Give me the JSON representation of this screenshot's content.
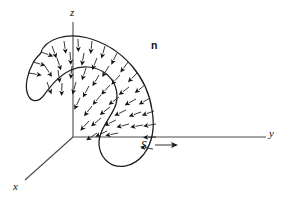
{
  "figure": {
    "caption_absent": true,
    "background_color": "#ffffff",
    "ink_color": "#141414",
    "axis_color": "#4a4a4a",
    "width": 289,
    "height": 202
  },
  "axes": {
    "origin": {
      "x": 73,
      "y": 137
    },
    "z": {
      "label": "z",
      "label_x": 71,
      "label_y": 8,
      "from": {
        "x": 73,
        "y": 137
      },
      "to": {
        "x": 73,
        "y": 22
      }
    },
    "y": {
      "label": "y",
      "label_x": 271,
      "label_y": 130,
      "from": {
        "x": 73,
        "y": 137
      },
      "to": {
        "x": 266,
        "y": 137
      }
    },
    "x": {
      "label": "x",
      "label_x": 14,
      "label_y": 183,
      "from": {
        "x": 73,
        "y": 137
      },
      "to": {
        "x": 25,
        "y": 180
      }
    }
  },
  "labels": {
    "normal_vector": "n",
    "normal_x": 152,
    "normal_y": 44,
    "surface": "S",
    "surface_x": 143,
    "surface_y": 141
  },
  "surface": {
    "name": "S",
    "description": "oriented curved surface shaped like a bent sheet crossing the z axis",
    "outline_path": "M 40.5 53.5 C 45 38 68 33 86 37.5 C 104 42 120 52 132 66 C 144 80 150 96 152 110 C 155 127 152 143 144 154 C 134 167 118 170 108 162 C 99 155 97 143 101 133 C 105 122 113 114 116 104 C 119 92 115 80 105 73 C 95 66 82 65 71 70 C 58 76 50 87 44 95 C 38 103 31 102 28 95 C 24 86 28 72 33 63 C 35 59 38 56 40.5 53.5 Z",
    "crosses_axes": true
  },
  "chart_data": {
    "type": "diagram",
    "title": "",
    "subtitle": "",
    "elements": [
      {
        "kind": "axis",
        "label": "z",
        "direction": "up"
      },
      {
        "kind": "axis",
        "label": "y",
        "direction": "right"
      },
      {
        "kind": "axis",
        "label": "x",
        "direction": "down-left"
      },
      {
        "kind": "surface",
        "label": "S"
      },
      {
        "kind": "vector-field",
        "label": "n",
        "count": 78,
        "style": "outward unit normals"
      }
    ],
    "normals": [
      {
        "x": 41,
        "y": 52,
        "angle": 200
      },
      {
        "x": 33,
        "y": 62,
        "angle": 196
      },
      {
        "x": 29,
        "y": 73,
        "angle": 190
      },
      {
        "x": 52,
        "y": 46,
        "angle": 250
      },
      {
        "x": 64,
        "y": 41,
        "angle": 262
      },
      {
        "x": 78,
        "y": 39,
        "angle": 268
      },
      {
        "x": 92,
        "y": 41,
        "angle": 276
      },
      {
        "x": 105,
        "y": 46,
        "angle": 286
      },
      {
        "x": 117,
        "y": 53,
        "angle": 296
      },
      {
        "x": 128,
        "y": 62,
        "angle": 306
      },
      {
        "x": 137,
        "y": 73,
        "angle": 314
      },
      {
        "x": 145,
        "y": 85,
        "angle": 322
      },
      {
        "x": 150,
        "y": 98,
        "angle": 330
      },
      {
        "x": 154,
        "y": 111,
        "angle": 340
      },
      {
        "x": 156,
        "y": 124,
        "angle": 350
      },
      {
        "x": 156,
        "y": 137,
        "angle": 358
      },
      {
        "x": 153,
        "y": 149,
        "angle": 10
      },
      {
        "x": 57,
        "y": 58,
        "angle": 252
      },
      {
        "x": 70,
        "y": 52,
        "angle": 266
      },
      {
        "x": 84,
        "y": 53,
        "angle": 280
      },
      {
        "x": 97,
        "y": 58,
        "angle": 292
      },
      {
        "x": 109,
        "y": 66,
        "angle": 302
      },
      {
        "x": 120,
        "y": 75,
        "angle": 312
      },
      {
        "x": 129,
        "y": 87,
        "angle": 322
      },
      {
        "x": 136,
        "y": 99,
        "angle": 331
      },
      {
        "x": 141,
        "y": 112,
        "angle": 340
      },
      {
        "x": 143,
        "y": 125,
        "angle": 350
      },
      {
        "x": 45,
        "y": 66,
        "angle": 238
      },
      {
        "x": 58,
        "y": 70,
        "angle": 262
      },
      {
        "x": 72,
        "y": 66,
        "angle": 276
      },
      {
        "x": 86,
        "y": 68,
        "angle": 288
      },
      {
        "x": 99,
        "y": 75,
        "angle": 300
      },
      {
        "x": 110,
        "y": 85,
        "angle": 312
      },
      {
        "x": 119,
        "y": 97,
        "angle": 323
      },
      {
        "x": 126,
        "y": 110,
        "angle": 334
      },
      {
        "x": 129,
        "y": 124,
        "angle": 345
      },
      {
        "x": 47,
        "y": 82,
        "angle": 250
      },
      {
        "x": 62,
        "y": 83,
        "angle": 272
      },
      {
        "x": 76,
        "y": 82,
        "angle": 286
      },
      {
        "x": 89,
        "y": 86,
        "angle": 298
      },
      {
        "x": 101,
        "y": 95,
        "angle": 310
      },
      {
        "x": 110,
        "y": 107,
        "angle": 322
      },
      {
        "x": 116,
        "y": 120,
        "angle": 334
      },
      {
        "x": 80,
        "y": 98,
        "angle": 296
      },
      {
        "x": 92,
        "y": 106,
        "angle": 308
      },
      {
        "x": 101,
        "y": 118,
        "angle": 320
      },
      {
        "x": 107,
        "y": 131,
        "angle": 334
      },
      {
        "x": 89,
        "y": 121,
        "angle": 312
      },
      {
        "x": 97,
        "y": 133,
        "angle": 326
      },
      {
        "x": 118,
        "y": 133,
        "angle": 348
      }
    ]
  },
  "annotations": {
    "surface_pointer": {
      "from": {
        "x": 156,
        "y": 145
      },
      "to": {
        "x": 176,
        "y": 145
      },
      "label": "S"
    }
  }
}
